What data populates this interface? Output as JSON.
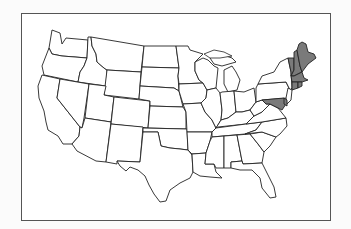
{
  "map": {
    "title": "",
    "type": "outline map",
    "region": "Contiguous United States",
    "highlight_color": "#7a7a7a",
    "base_color": "#ffffff",
    "border_color": "#222222",
    "highlighted_states": [
      "Maine",
      "New Hampshire",
      "Vermont",
      "Massachusetts",
      "Rhode Island",
      "Connecticut"
    ],
    "highlighted_region_name": "New England"
  }
}
